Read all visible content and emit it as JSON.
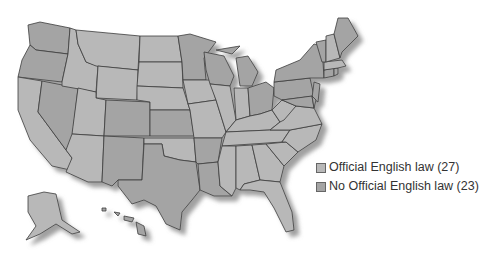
{
  "map": {
    "type": "choropleth",
    "region": "United States",
    "colors": {
      "official": "#b8b8b8",
      "no_official": "#a4a4a4",
      "border": "#3c3c3c",
      "shadow": "#9a9a9a"
    }
  },
  "legend": {
    "items": [
      {
        "label": "Official English law (27)",
        "color": "#b8b8b8"
      },
      {
        "label": "No Official English law (23)",
        "color": "#a4a4a4"
      }
    ]
  },
  "states": {
    "official": [
      "MT",
      "ND",
      "SD",
      "WY",
      "ID",
      "UT",
      "NE",
      "IA",
      "MO",
      "IL",
      "IN",
      "KY",
      "TN",
      "MS",
      "AL",
      "GA",
      "FL",
      "SC",
      "NC",
      "VA",
      "WV",
      "NH",
      "MA",
      "CA",
      "AZ",
      "OK",
      "AK"
    ],
    "no_official": [
      "WA",
      "OR",
      "NV",
      "CO",
      "NM",
      "TX",
      "KS",
      "MN",
      "WI",
      "MI",
      "OH",
      "PA",
      "NY",
      "NJ",
      "DE",
      "MD",
      "CT",
      "RI",
      "VT",
      "ME",
      "AR",
      "LA",
      "HI"
    ]
  }
}
